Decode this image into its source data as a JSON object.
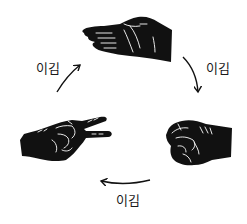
{
  "diagram": {
    "type": "cycle",
    "title": "",
    "colors": {
      "ink": "#111111",
      "background": "#ffffff",
      "highlight": "#ffffff"
    },
    "nodes": [
      {
        "id": "paper",
        "name": "paper-hand",
        "icon": "open-palm-hand"
      },
      {
        "id": "rock",
        "name": "rock-fist",
        "icon": "closed-fist-hand"
      },
      {
        "id": "scissors",
        "name": "scissors-hand",
        "icon": "v-sign-hand"
      }
    ],
    "edges": [
      {
        "from": "paper",
        "to": "rock",
        "label": "이김"
      },
      {
        "from": "rock",
        "to": "scissors",
        "label": "이김"
      },
      {
        "from": "scissors",
        "to": "paper",
        "label": "이김"
      }
    ]
  },
  "labels": {
    "top_right": "이김",
    "bottom": "이김",
    "top_left": "이김"
  }
}
